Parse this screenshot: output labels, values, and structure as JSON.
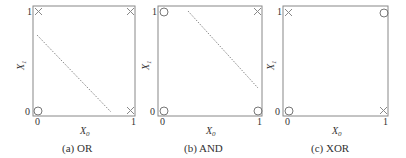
{
  "panels": [
    {
      "caption": "(a) OR",
      "xlabel": "X",
      "xlabel_sub": "0",
      "ylabel": "X",
      "ylabel_sub": "1",
      "x_ticks": [
        "0",
        "1"
      ],
      "y_ticks": [
        "0",
        "1"
      ],
      "points": [
        {
          "x": 0,
          "y": 0,
          "marker": "circle"
        },
        {
          "x": 0,
          "y": 1,
          "marker": "cross"
        },
        {
          "x": 1,
          "y": 0,
          "marker": "cross"
        },
        {
          "x": 1,
          "y": 1,
          "marker": "cross"
        }
      ],
      "boundary": "dotted diagonal line"
    },
    {
      "caption": "(b) AND",
      "xlabel": "X",
      "xlabel_sub": "0",
      "ylabel": "X",
      "ylabel_sub": "1",
      "x_ticks": [
        "0",
        "1"
      ],
      "y_ticks": [
        "0",
        "1"
      ],
      "points": [
        {
          "x": 0,
          "y": 0,
          "marker": "circle"
        },
        {
          "x": 0,
          "y": 1,
          "marker": "circle"
        },
        {
          "x": 1,
          "y": 0,
          "marker": "circle"
        },
        {
          "x": 1,
          "y": 1,
          "marker": "cross"
        }
      ],
      "boundary": "dotted diagonal line"
    },
    {
      "caption": "(c) XOR",
      "xlabel": "X",
      "xlabel_sub": "0",
      "ylabel": "X",
      "ylabel_sub": "1",
      "x_ticks": [
        "0",
        "1"
      ],
      "y_ticks": [
        "0",
        "1"
      ],
      "points": [
        {
          "x": 0,
          "y": 0,
          "marker": "circle"
        },
        {
          "x": 0,
          "y": 1,
          "marker": "cross"
        },
        {
          "x": 1,
          "y": 0,
          "marker": "cross"
        },
        {
          "x": 1,
          "y": 1,
          "marker": "circle"
        }
      ],
      "boundary": "none"
    }
  ]
}
